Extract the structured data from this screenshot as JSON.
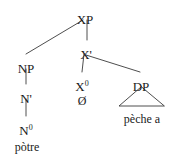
{
  "figure": {
    "type": "syntax-tree",
    "background_color": "#ffffff",
    "line_color": "#3a3a3a",
    "text_color": "#1a1a1a"
  },
  "nodes": {
    "root": {
      "label": "XP",
      "x": 85,
      "y": 13
    },
    "np": {
      "label": "NP",
      "x": 26,
      "y": 62
    },
    "nbar": {
      "label": "N'",
      "x": 26,
      "y": 92
    },
    "n0_base": {
      "label": "N",
      "superscript": "0",
      "x": 26,
      "y": 124
    },
    "xbar": {
      "label": "X'",
      "x": 86,
      "y": 48
    },
    "x0_base": {
      "label": "X",
      "superscript": "0",
      "x": 82,
      "y": 80
    },
    "null_head": {
      "label": "Ø",
      "x": 82,
      "y": 95
    },
    "dp": {
      "label": "DP",
      "x": 141,
      "y": 80
    }
  },
  "terminals": {
    "np_word": {
      "text": "pòtre",
      "x": 27,
      "y": 141
    },
    "dp_phrase": {
      "text": "pèche a",
      "x": 142,
      "y": 113
    }
  },
  "triangle": {
    "apex_x": 141,
    "apex_y": 87,
    "left_x": 119,
    "right_x": 164,
    "base_y": 106
  },
  "edges": [
    {
      "name": "xp-to-np",
      "x1": 83,
      "y1": 20,
      "x2": 26,
      "y2": 54
    },
    {
      "name": "xp-to-xbar",
      "x1": 87,
      "y1": 20,
      "x2": 87,
      "y2": 40
    },
    {
      "name": "xbar-to-x0",
      "x1": 84,
      "y1": 54,
      "x2": 82,
      "y2": 72
    },
    {
      "name": "xbar-to-dp",
      "x1": 86,
      "y1": 55,
      "x2": 140,
      "y2": 72
    },
    {
      "name": "np-to-nbar",
      "x1": 26,
      "y1": 69,
      "x2": 26,
      "y2": 84
    },
    {
      "name": "nbar-to-n0",
      "x1": 26,
      "y1": 99,
      "x2": 26,
      "y2": 116
    }
  ]
}
